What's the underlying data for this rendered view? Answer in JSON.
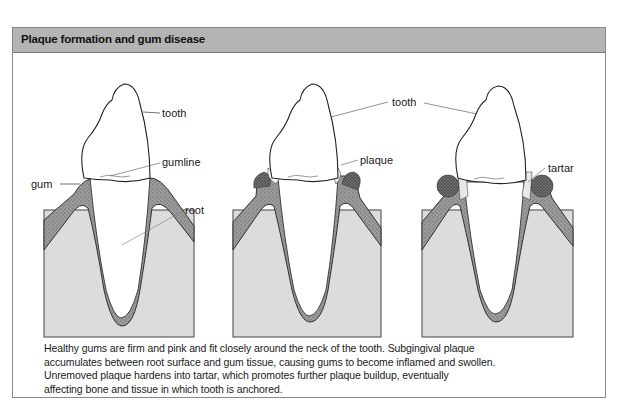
{
  "figure": {
    "title": "Plaque formation and gum disease",
    "panels": [
      {
        "id": "healthy",
        "labels": [
          {
            "text": "tooth"
          },
          {
            "text": "gumline"
          },
          {
            "text": "gum"
          },
          {
            "text": "root"
          }
        ]
      },
      {
        "id": "plaque",
        "labels": [
          {
            "text": "plaque"
          }
        ]
      },
      {
        "id": "tartar",
        "labels": [
          {
            "text": "tartar"
          }
        ]
      }
    ],
    "shared_labels": {
      "tooth": "tooth"
    },
    "caption_lines": [
      "Healthy gums are firm and pink and fit closely around the neck of the tooth. Subgingival plaque",
      "accumulates between root surface and gum tissue, causing gums to become inflamed and swollen.",
      "Unremoved plaque hardens into tartar, which promotes further plaque buildup, eventually",
      "affecting bone and tissue in which tooth is anchored."
    ],
    "colors": {
      "header_bg": "#b4b4b4",
      "bone": "#dcdcdc",
      "gum": "#8c8c8c",
      "tooth": "#ffffff",
      "outline": "#333333"
    }
  }
}
